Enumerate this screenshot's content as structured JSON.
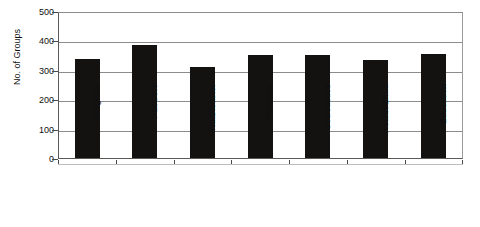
{
  "chart_data": {
    "type": "bar",
    "title": "",
    "subtitle": "",
    "xlabel": "",
    "ylabel": "No. of Groups",
    "ylim": [
      0,
      500
    ],
    "ytick_values": [
      0,
      100,
      200,
      300,
      400,
      500
    ],
    "ytick_labels": [
      "0",
      "100",
      "200",
      "300",
      "400",
      "500"
    ],
    "grid": true,
    "legend": false,
    "legend_position": "none",
    "bar_color": "#141210",
    "background_color": "#ffffff",
    "gridline_color": "#8c8c8c",
    "axis_color": "#4a4a4a",
    "categories": [
      "Religious",
      "PubServ",
      "NatDisaster",
      "Financial",
      "Soc/Justice",
      "Health/Em...",
      "Education"
    ],
    "values": [
      337,
      385,
      310,
      352,
      352,
      333,
      354
    ],
    "series": [
      {
        "name": "No. of Groups",
        "values": [
          337,
          385,
          310,
          352,
          352,
          333,
          354
        ]
      }
    ]
  }
}
